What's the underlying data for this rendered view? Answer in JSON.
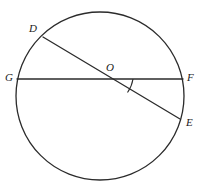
{
  "figure": {
    "name": "circle-with-two-intersecting-chords",
    "canvas": {
      "width": 206,
      "height": 191
    },
    "stroke_color": "#2b2b2b",
    "label_color": "#1a1a1a",
    "background_color": "#ffffff",
    "stroke_width": 1.3
  },
  "circle": {
    "name": "main-circle",
    "cx": 100,
    "cy": 96,
    "r": 84
  },
  "segments": [
    {
      "id": "GF",
      "name": "diameter-g-f",
      "from": "G",
      "to": "F",
      "x1": 17,
      "y1": 79,
      "x2": 183,
      "y2": 79
    },
    {
      "id": "DE",
      "name": "diameter-d-e",
      "from": "D",
      "to": "E",
      "x1": 43,
      "y1": 37,
      "x2": 180,
      "y2": 119
    }
  ],
  "angle_mark": {
    "name": "angle-arc-foe",
    "vertex": "O",
    "between": [
      "F",
      "E"
    ],
    "path": "M 133 79 A 32 32 0 0 1 127.5 92.5"
  },
  "points": [
    {
      "id": "D",
      "name": "point-d",
      "label": "D",
      "label_x": 29,
      "label_y": 23,
      "px": 43,
      "py": 37
    },
    {
      "id": "G",
      "name": "point-g",
      "label": "G",
      "label_x": 5,
      "label_y": 72,
      "px": 17,
      "py": 79
    },
    {
      "id": "O",
      "name": "point-o",
      "label": "O",
      "label_x": 106,
      "label_y": 62,
      "px": 101,
      "py": 79
    },
    {
      "id": "F",
      "name": "point-f",
      "label": "F",
      "label_x": 187,
      "label_y": 72,
      "px": 183,
      "py": 79
    },
    {
      "id": "E",
      "name": "point-e",
      "label": "E",
      "label_x": 186,
      "label_y": 117,
      "px": 180,
      "py": 119
    }
  ]
}
